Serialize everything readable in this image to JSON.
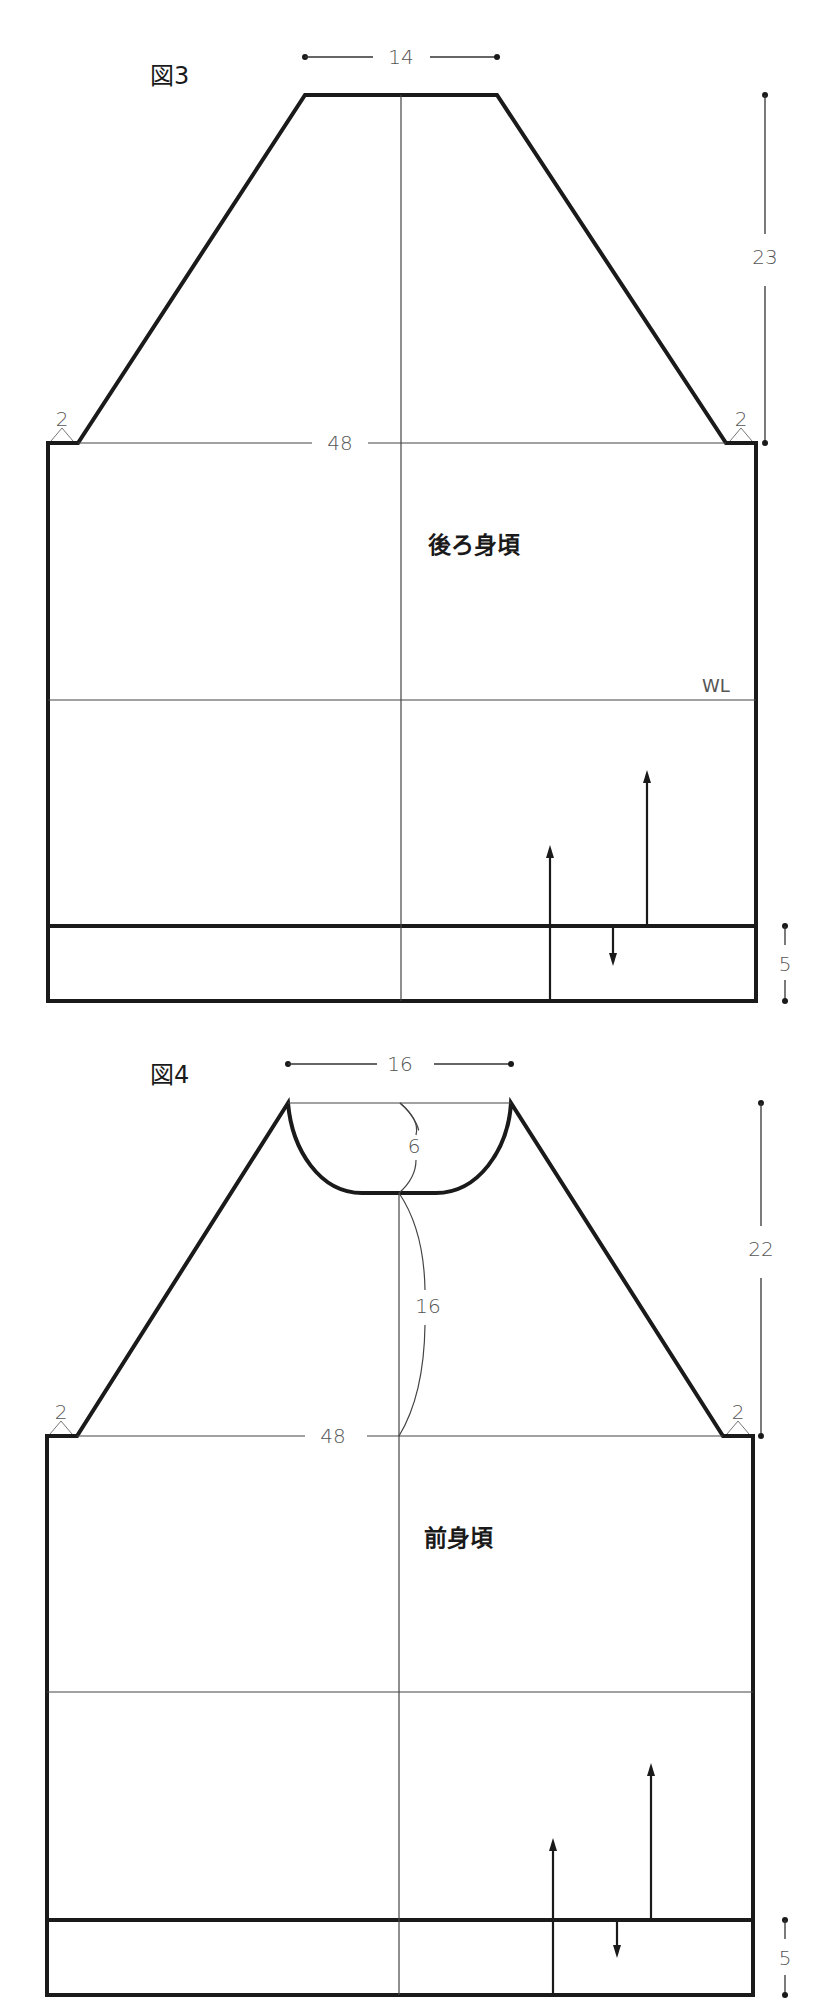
{
  "figures": [
    {
      "id": "fig3",
      "title": "図3",
      "part_label": "後ろ身頃",
      "neck_width": "14",
      "raglan_height": "23",
      "chest_width": "48",
      "shoulder_left": "2",
      "shoulder_right": "2",
      "waist_line_label": "WL",
      "band_height": "5"
    },
    {
      "id": "fig4",
      "title": "図4",
      "part_label": "前身頃",
      "neck_width": "16",
      "neck_depth": "6",
      "center_front_length": "16",
      "raglan_height": "22",
      "chest_width": "48",
      "shoulder_left": "2",
      "shoulder_right": "2",
      "band_height": "5"
    }
  ],
  "colors": {
    "line": "#1a1a1a",
    "guide": "#444444",
    "text": "#555555",
    "background": "#ffffff"
  }
}
